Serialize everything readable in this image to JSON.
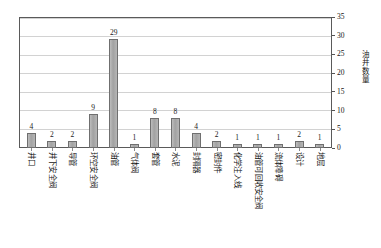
{
  "chart_data": {
    "type": "bar",
    "title": "",
    "xlabel": "",
    "ylabel": "油井数量",
    "ylim": [
      0,
      35
    ],
    "ytick_step": 5,
    "yticks": [
      35,
      30,
      25,
      20,
      15,
      10,
      5,
      0
    ],
    "grid": true,
    "legend": "none",
    "bar_color": "#a9a9a9",
    "bar_border_color": "#6f6f6f",
    "gridline_color": "#d2d2d2",
    "frame_color": "#5a5a5a",
    "categories": [
      "井口",
      "井下安全阀",
      "导管",
      "环空安全阀",
      "油管",
      "气体阀",
      "套管",
      "水泥",
      "封隔器",
      "密封件",
      "化学注入线",
      "油管可回收安全阀",
      "流体障碍",
      "设计",
      "地层"
    ],
    "values": [
      4,
      2,
      2,
      9,
      29,
      1,
      8,
      8,
      4,
      2,
      1,
      1,
      1,
      2,
      1
    ],
    "data_labels": [
      "4",
      "2",
      "2",
      "9",
      "29",
      "1",
      "8",
      "8",
      "4",
      "2",
      "1",
      "1",
      "1",
      "2",
      "1"
    ]
  }
}
